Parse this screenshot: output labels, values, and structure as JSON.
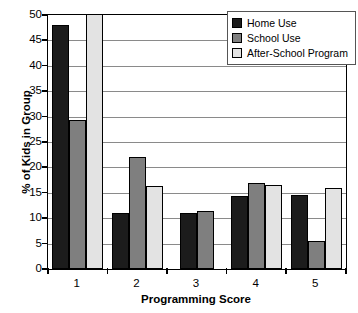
{
  "chart_data": {
    "type": "bar",
    "title": "",
    "xlabel": "Programming Score",
    "ylabel": "% of Kids in Group",
    "categories": [
      "1",
      "2",
      "3",
      "4",
      "5"
    ],
    "ylim": [
      0,
      50
    ],
    "ytick_step": 5,
    "yticks": [
      "50",
      "45",
      "40",
      "35",
      "30",
      "25",
      "20",
      "15",
      "10",
      "5",
      "0"
    ],
    "grid": true,
    "legend_position": "top-right",
    "series": [
      {
        "name": "Home Use",
        "color": "#1c1c1c",
        "values": [
          48.0,
          11.0,
          11.0,
          14.3,
          14.5
        ]
      },
      {
        "name": "School Use",
        "color": "#7f7f7f",
        "values": [
          29.3,
          22.0,
          11.5,
          17.0,
          5.5
        ]
      },
      {
        "name": "After-School Program",
        "color": "#e3e3e3",
        "values": [
          51.0,
          16.4,
          0,
          16.6,
          16.0
        ]
      }
    ]
  }
}
